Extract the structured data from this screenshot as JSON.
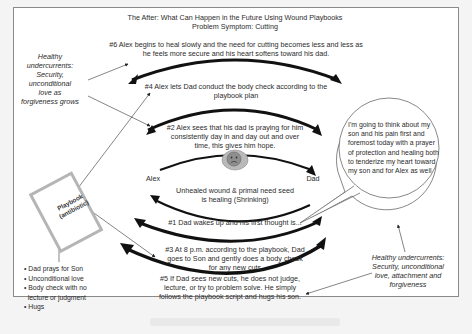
{
  "title": {
    "line1": "The After: What Can Happen in the Future Using Wound Playbooks",
    "line2": "Problem Symptom: Cutting"
  },
  "steps": {
    "step6": "#6 Alex begins to heal slowly and the need for cutting becomes less and less as he feels more secure and his heart softens toward his dad.",
    "step4_line1": "#4 Alex lets Dad conduct the body check according to the",
    "step4_line2": "playbook plan",
    "step2_line1": "#2 Alex sees that his dad is praying for him",
    "step2_line2": "consistently day in and day out and over",
    "step2_line3": "time, this gives him hope.",
    "step1": "#1 Dad wakes up and his first thought is...",
    "step3_line1": "#3 At 8 p.m. according to the playbook, Dad",
    "step3_line2": "goes to Son and gently does a body check",
    "step3_line3": "for any new cuts",
    "step5_line1": "#5 If Dad sees new cuts, he does not judge,",
    "step5_line2": "lecture, or try to problem solve. He simply",
    "step5_line3": "follows the playbook script and hugs his son."
  },
  "center": {
    "left_label": "Alex",
    "right_label": "Dad",
    "wound_line1": "Unhealed wound & primal need seed",
    "wound_line2": "is healing (Shrinking)",
    "wound_icon": "sad-face-wound-icon"
  },
  "undercurrents_left": {
    "lines": [
      "Healthy",
      "undercurrents:",
      "Security,",
      "unconditional",
      "love as",
      "forgiveness grows"
    ]
  },
  "undercurrents_right": {
    "lines": [
      "Healthy undercurrents:",
      "Security, unconditional",
      "love, attachment and",
      "forgiveness"
    ]
  },
  "thought_bubble": {
    "text": "I'm going to think about my son and his pain first and foremost today with a prayer of protection and healing both to tenderize my heart toward my son and for Alex as well"
  },
  "playbook": {
    "line1": "Playbook",
    "line2": "(antibiotic)",
    "bullets": [
      "Dad prays for Son",
      "Unconditional love",
      "Body check with no",
      "lecture or judgment",
      "Hugs"
    ]
  },
  "colors": {
    "background": "#f4f4f4",
    "frame": "#ffffff",
    "arrow": "#111111",
    "text": "#2b2b2b",
    "book_border": "#b5b5b5",
    "wound_fill": "#9a9a9a"
  }
}
